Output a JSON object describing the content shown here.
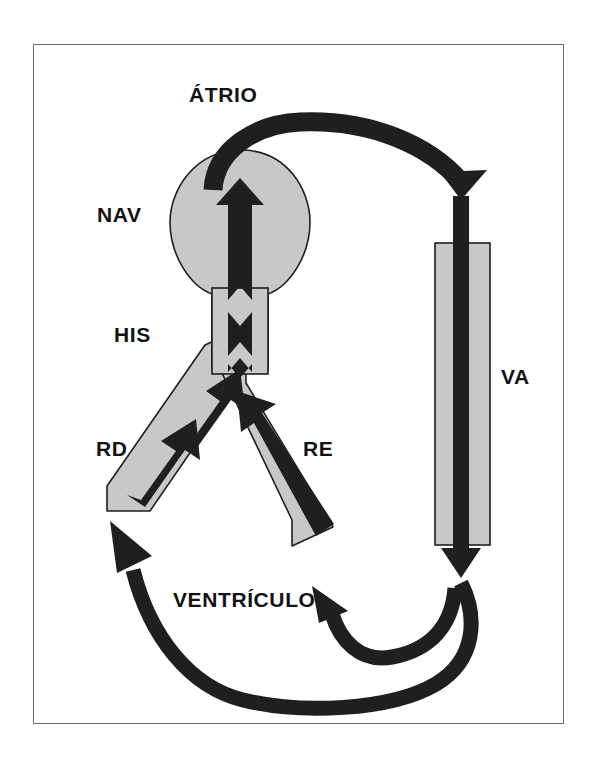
{
  "figure": {
    "kind": "cardiac-conduction-reentry-diagram",
    "background_color": "#ffffff",
    "frame_color": "#6e6e6e",
    "tissue_fill_color": "#c8c8c8",
    "tissue_stroke_color": "#1f1f1f",
    "impulse_color": "#1f1f1f"
  },
  "labels": {
    "atrium": "ÁTRIO",
    "av_node": "NAV",
    "his_bundle": "HIS",
    "right_bundle_branch": "RD",
    "left_bundle_branch": "RE",
    "accessory_pathway": "VA",
    "ventricle": "VENTRÍCULO"
  },
  "structures": [
    {
      "name": "av-node-oval",
      "label": "NAV",
      "shape": "ellipse",
      "fill": "#c8c8c8"
    },
    {
      "name": "his-bundle-trunk",
      "label": "HIS",
      "shape": "vertical-band",
      "fill": "#c8c8c8"
    },
    {
      "name": "right-bundle-branch-band",
      "label": "RD",
      "shape": "diagonal-band-left",
      "fill": "#c8c8c8"
    },
    {
      "name": "left-bundle-branch-band",
      "label": "RE",
      "shape": "diagonal-band-right",
      "fill": "#c8c8c8"
    },
    {
      "name": "accessory-pathway-rectangle",
      "label": "VA",
      "shape": "rectangle",
      "fill": "#c8c8c8"
    }
  ],
  "impulse_arrows": [
    {
      "name": "atrium-to-accessory-arc",
      "from": "ÁTRIO",
      "to": "VA",
      "direction": "clockwise-down-right"
    },
    {
      "name": "accessory-pathway-down-arrow",
      "from": "VA",
      "to": "VENTRÍCULO",
      "direction": "down"
    },
    {
      "name": "ventricle-return-arc",
      "from": "VENTRÍCULO",
      "to": "RD",
      "direction": "counterclockwise-up-left"
    },
    {
      "name": "ventricle-short-arc",
      "from": "VENTRÍCULO",
      "to": "VENTRÍCULO",
      "direction": "up-left"
    },
    {
      "name": "right-branch-retrograde-arrow",
      "from": "RD",
      "to": "HIS",
      "direction": "up-right"
    },
    {
      "name": "left-branch-retrograde-arrow",
      "from": "RE",
      "to": "HIS",
      "direction": "up-left"
    },
    {
      "name": "his-retrograde-arrow",
      "from": "HIS",
      "to": "NAV",
      "direction": "up"
    },
    {
      "name": "av-node-retrograde-arrow",
      "from": "NAV",
      "to": "ÁTRIO",
      "direction": "up"
    }
  ]
}
